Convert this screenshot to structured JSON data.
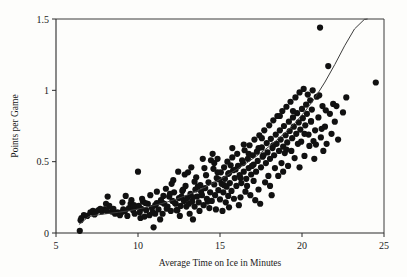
{
  "chart_data": {
    "type": "scatter",
    "title": "",
    "subtitle": "",
    "xlabel": "Average Time on Ice in Minutes",
    "ylabel": "Points per Game",
    "xlim": [
      5,
      25
    ],
    "ylim": [
      0,
      1.5
    ],
    "xticks": [
      5,
      10,
      15,
      20,
      25
    ],
    "yticks": [
      0,
      0.5,
      1,
      1.5
    ],
    "xtick_labels": [
      "5",
      "10",
      "15",
      "20",
      "25"
    ],
    "ytick_labels": [
      "0",
      "0.5",
      "1",
      "1.5"
    ],
    "grid": false,
    "legend": null,
    "legend_position": "none",
    "marker_color": "#111111",
    "marker_size": 3.1,
    "fit_curve": {
      "name": "fitted trend",
      "color": "#3d3d3d",
      "x": [
        6.4,
        7.0,
        7.6,
        8.2,
        8.8,
        9.4,
        10.0,
        10.6,
        11.2,
        11.8,
        12.4,
        13.0,
        13.6,
        14.2,
        14.8,
        15.4,
        16.0,
        16.6,
        17.2,
        17.8,
        18.4,
        19.0,
        19.6,
        20.2,
        20.8,
        21.4,
        22.0,
        22.6,
        23.2,
        23.8,
        24.0
      ],
      "y": [
        0.06,
        0.115,
        0.128,
        0.137,
        0.145,
        0.155,
        0.168,
        0.182,
        0.199,
        0.218,
        0.24,
        0.266,
        0.295,
        0.327,
        0.363,
        0.402,
        0.444,
        0.489,
        0.537,
        0.589,
        0.645,
        0.706,
        0.775,
        0.855,
        0.949,
        1.058,
        1.181,
        1.312,
        1.43,
        1.497,
        1.5
      ]
    },
    "points": [
      [
        6.45,
        0.015
      ],
      [
        6.5,
        0.09
      ],
      [
        6.55,
        0.105
      ],
      [
        6.7,
        0.125
      ],
      [
        6.9,
        0.12
      ],
      [
        7.1,
        0.145
      ],
      [
        7.25,
        0.155
      ],
      [
        7.45,
        0.15
      ],
      [
        7.6,
        0.16
      ],
      [
        7.8,
        0.152
      ],
      [
        7.95,
        0.165
      ],
      [
        8.1,
        0.155
      ],
      [
        8.15,
        0.255
      ],
      [
        8.25,
        0.19
      ],
      [
        8.4,
        0.15
      ],
      [
        8.6,
        0.135
      ],
      [
        8.75,
        0.145
      ],
      [
        8.9,
        0.125
      ],
      [
        9.05,
        0.215
      ],
      [
        9.1,
        0.165
      ],
      [
        9.2,
        0.155
      ],
      [
        9.35,
        0.12
      ],
      [
        9.45,
        0.175
      ],
      [
        9.55,
        0.205
      ],
      [
        9.7,
        0.16
      ],
      [
        9.8,
        0.135
      ],
      [
        9.9,
        0.185
      ],
      [
        10.0,
        0.43
      ],
      [
        10.05,
        0.19
      ],
      [
        10.1,
        0.145
      ],
      [
        10.2,
        0.17
      ],
      [
        10.3,
        0.22
      ],
      [
        10.4,
        0.115
      ],
      [
        10.5,
        0.16
      ],
      [
        10.6,
        0.205
      ],
      [
        10.7,
        0.125
      ],
      [
        10.85,
        0.175
      ],
      [
        10.95,
        0.04
      ],
      [
        11.05,
        0.195
      ],
      [
        11.15,
        0.29
      ],
      [
        11.25,
        0.165
      ],
      [
        11.4,
        0.23
      ],
      [
        11.5,
        0.135
      ],
      [
        11.6,
        0.205
      ],
      [
        11.7,
        0.31
      ],
      [
        11.8,
        0.185
      ],
      [
        11.9,
        0.255
      ],
      [
        12.0,
        0.155
      ],
      [
        12.1,
        0.225
      ],
      [
        12.2,
        0.285
      ],
      [
        12.3,
        0.205
      ],
      [
        12.4,
        0.16
      ],
      [
        12.5,
        0.245
      ],
      [
        12.6,
        0.19
      ],
      [
        12.7,
        0.295
      ],
      [
        12.8,
        0.225
      ],
      [
        12.9,
        0.33
      ],
      [
        13.0,
        0.245
      ],
      [
        13.05,
        0.425
      ],
      [
        13.1,
        0.205
      ],
      [
        13.2,
        0.275
      ],
      [
        13.3,
        0.22
      ],
      [
        13.35,
        0.095
      ],
      [
        13.45,
        0.185
      ],
      [
        13.5,
        0.305
      ],
      [
        13.6,
        0.255
      ],
      [
        13.7,
        0.215
      ],
      [
        13.8,
        0.335
      ],
      [
        13.9,
        0.265
      ],
      [
        14.0,
        0.195
      ],
      [
        14.05,
        0.455
      ],
      [
        14.1,
        0.315
      ],
      [
        14.2,
        0.24
      ],
      [
        14.3,
        0.355
      ],
      [
        14.4,
        0.285
      ],
      [
        14.5,
        0.225
      ],
      [
        14.6,
        0.45
      ],
      [
        14.65,
        0.34
      ],
      [
        14.7,
        0.265
      ],
      [
        14.8,
        0.385
      ],
      [
        14.85,
        0.52
      ],
      [
        14.9,
        0.3
      ],
      [
        15.0,
        0.235
      ],
      [
        15.05,
        0.425
      ],
      [
        15.1,
        0.345
      ],
      [
        15.2,
        0.285
      ],
      [
        15.25,
        0.46
      ],
      [
        15.3,
        0.38
      ],
      [
        15.4,
        0.325
      ],
      [
        15.45,
        0.5
      ],
      [
        15.5,
        0.415
      ],
      [
        15.55,
        0.18
      ],
      [
        15.6,
        0.35
      ],
      [
        15.7,
        0.295
      ],
      [
        15.75,
        0.53
      ],
      [
        15.8,
        0.44
      ],
      [
        15.9,
        0.385
      ],
      [
        16.0,
        0.33
      ],
      [
        16.05,
        0.555
      ],
      [
        16.1,
        0.47
      ],
      [
        16.2,
        0.405
      ],
      [
        16.25,
        0.25
      ],
      [
        16.3,
        0.35
      ],
      [
        16.4,
        0.49
      ],
      [
        16.45,
        0.43
      ],
      [
        16.5,
        0.58
      ],
      [
        16.6,
        0.38
      ],
      [
        16.7,
        0.52
      ],
      [
        16.75,
        0.455
      ],
      [
        16.8,
        0.615
      ],
      [
        16.9,
        0.41
      ],
      [
        17.0,
        0.545
      ],
      [
        17.05,
        0.48
      ],
      [
        17.1,
        0.655
      ],
      [
        17.2,
        0.43
      ],
      [
        17.25,
        0.57
      ],
      [
        17.3,
        0.505
      ],
      [
        17.35,
        0.305
      ],
      [
        17.4,
        0.685
      ],
      [
        17.5,
        0.46
      ],
      [
        17.55,
        0.6
      ],
      [
        17.6,
        0.535
      ],
      [
        17.7,
        0.72
      ],
      [
        17.8,
        0.49
      ],
      [
        17.85,
        0.63
      ],
      [
        17.9,
        0.565
      ],
      [
        18.0,
        0.755
      ],
      [
        18.05,
        0.52
      ],
      [
        18.1,
        0.66
      ],
      [
        18.2,
        0.595
      ],
      [
        18.25,
        0.79
      ],
      [
        18.3,
        0.545
      ],
      [
        18.4,
        0.69
      ],
      [
        18.45,
        0.625
      ],
      [
        18.5,
        0.82
      ],
      [
        18.6,
        0.575
      ],
      [
        18.65,
        0.72
      ],
      [
        18.7,
        0.655
      ],
      [
        18.8,
        0.855
      ],
      [
        18.85,
        0.605
      ],
      [
        18.9,
        0.75
      ],
      [
        19.0,
        0.685
      ],
      [
        19.05,
        0.885
      ],
      [
        19.1,
        0.635
      ],
      [
        19.2,
        0.78
      ],
      [
        19.25,
        0.715
      ],
      [
        19.3,
        0.92
      ],
      [
        19.4,
        0.665
      ],
      [
        19.45,
        0.81
      ],
      [
        19.5,
        0.745
      ],
      [
        19.6,
        0.95
      ],
      [
        19.65,
        0.695
      ],
      [
        19.7,
        0.84
      ],
      [
        19.8,
        0.775
      ],
      [
        19.85,
        0.985
      ],
      [
        19.9,
        0.725
      ],
      [
        20.0,
        0.87
      ],
      [
        20.05,
        0.805
      ],
      [
        20.1,
        1.01
      ],
      [
        20.2,
        0.755
      ],
      [
        20.25,
        0.9
      ],
      [
        20.3,
        0.835
      ],
      [
        20.4,
        0.69
      ],
      [
        20.5,
        0.93
      ],
      [
        20.55,
        0.785
      ],
      [
        20.6,
        0.865
      ],
      [
        20.7,
        0.645
      ],
      [
        20.8,
        0.72
      ],
      [
        20.9,
        0.955
      ],
      [
        21.0,
        0.81
      ],
      [
        21.1,
        1.44
      ],
      [
        21.15,
        0.67
      ],
      [
        21.25,
        0.89
      ],
      [
        21.4,
        0.745
      ],
      [
        21.5,
        0.625
      ],
      [
        21.6,
        1.17
      ],
      [
        21.7,
        0.835
      ],
      [
        21.8,
        0.695
      ],
      [
        21.9,
        0.905
      ],
      [
        22.0,
        0.78
      ],
      [
        22.2,
        0.655
      ],
      [
        22.5,
        0.845
      ],
      [
        22.7,
        0.95
      ],
      [
        24.5,
        1.055
      ],
      [
        12.15,
        0.37
      ],
      [
        12.55,
        0.12
      ],
      [
        11.35,
        0.095
      ],
      [
        10.75,
        0.265
      ],
      [
        13.75,
        0.155
      ],
      [
        14.35,
        0.175
      ],
      [
        15.15,
        0.155
      ],
      [
        16.15,
        0.195
      ],
      [
        17.15,
        0.23
      ],
      [
        18.15,
        0.265
      ],
      [
        19.15,
        0.47
      ],
      [
        20.15,
        0.54
      ],
      [
        13.25,
        0.46
      ],
      [
        12.85,
        0.41
      ],
      [
        14.45,
        0.51
      ],
      [
        15.85,
        0.24
      ],
      [
        16.55,
        0.29
      ],
      [
        17.75,
        0.355
      ],
      [
        18.55,
        0.4
      ],
      [
        19.35,
        0.575
      ],
      [
        9.25,
        0.26
      ],
      [
        8.05,
        0.205
      ],
      [
        7.35,
        0.13
      ],
      [
        11.55,
        0.26
      ],
      [
        12.35,
        0.16
      ],
      [
        13.15,
        0.135
      ],
      [
        14.75,
        0.165
      ],
      [
        15.35,
        0.215
      ],
      [
        16.85,
        0.265
      ],
      [
        17.45,
        0.205
      ],
      [
        12.05,
        0.345
      ],
      [
        13.55,
        0.39
      ],
      [
        14.15,
        0.405
      ],
      [
        15.65,
        0.475
      ],
      [
        16.35,
        0.51
      ],
      [
        17.65,
        0.545
      ],
      [
        18.75,
        0.49
      ],
      [
        19.55,
        0.525
      ],
      [
        20.45,
        0.61
      ],
      [
        21.3,
        0.575
      ],
      [
        11.95,
        0.275
      ],
      [
        12.75,
        0.305
      ],
      [
        13.85,
        0.29
      ],
      [
        14.95,
        0.375
      ],
      [
        15.95,
        0.445
      ],
      [
        16.95,
        0.47
      ],
      [
        18.35,
        0.455
      ],
      [
        19.75,
        0.625
      ],
      [
        10.45,
        0.21
      ],
      [
        11.05,
        0.135
      ],
      [
        12.25,
        0.21
      ],
      [
        13.35,
        0.25
      ],
      [
        14.25,
        0.22
      ],
      [
        15.5,
        0.26
      ],
      [
        16.65,
        0.33
      ],
      [
        17.95,
        0.4
      ],
      [
        18.95,
        0.56
      ],
      [
        20.35,
        0.97
      ],
      [
        20.65,
        1.0
      ],
      [
        19.95,
        0.64
      ],
      [
        21.05,
        0.965
      ],
      [
        20.85,
        0.62
      ],
      [
        13.95,
        0.52
      ],
      [
        14.55,
        0.555
      ],
      [
        15.75,
        0.595
      ],
      [
        16.45,
        0.62
      ],
      [
        17.55,
        0.665
      ],
      [
        18.65,
        0.82
      ],
      [
        19.45,
        0.855
      ],
      [
        20.15,
        0.695
      ],
      [
        21.2,
        0.73
      ],
      [
        22.1,
        0.89
      ],
      [
        9.6,
        0.23
      ],
      [
        10.25,
        0.24
      ],
      [
        11.75,
        0.17
      ],
      [
        12.65,
        0.255
      ],
      [
        13.65,
        0.325
      ],
      [
        14.85,
        0.425
      ],
      [
        15.25,
        0.335
      ],
      [
        16.75,
        0.555
      ],
      [
        17.35,
        0.595
      ],
      [
        18.25,
        0.615
      ],
      [
        19.05,
        0.585
      ],
      [
        20.55,
        0.78
      ],
      [
        7.7,
        0.17
      ],
      [
        8.5,
        0.17
      ],
      [
        9.0,
        0.145
      ],
      [
        9.75,
        0.195
      ],
      [
        10.9,
        0.145
      ],
      [
        11.45,
        0.215
      ],
      [
        12.95,
        0.185
      ],
      [
        13.45,
        0.36
      ],
      [
        14.65,
        0.49
      ],
      [
        15.55,
        0.42
      ],
      [
        16.25,
        0.385
      ],
      [
        17.05,
        0.365
      ],
      [
        18.05,
        0.33
      ],
      [
        18.85,
        0.43
      ],
      [
        19.85,
        0.46
      ],
      [
        20.75,
        0.52
      ],
      [
        21.45,
        0.86
      ],
      [
        12.45,
        0.43
      ],
      [
        11.15,
        0.21
      ],
      [
        10.15,
        0.105
      ]
    ]
  }
}
